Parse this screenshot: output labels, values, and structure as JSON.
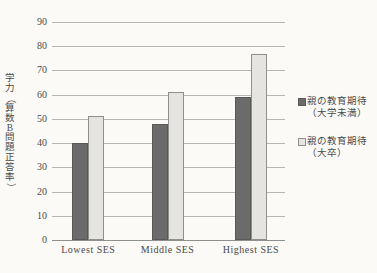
{
  "chart_data": {
    "type": "bar",
    "categories": [
      "Lowest SES",
      "Middle SES",
      "Highest SES"
    ],
    "series": [
      {
        "name": "親の教育期待（大学未満）",
        "color": "#6b6b6b",
        "values": [
          40,
          48,
          59
        ]
      },
      {
        "name": "親の教育期待（大卒）",
        "color": "#e5e4e1",
        "values": [
          51,
          61,
          77
        ]
      }
    ],
    "title": "",
    "xlabel": "",
    "ylabel": "学力（算数B問題正答率）",
    "ylim": [
      0,
      90
    ],
    "yticks": [
      0,
      10,
      20,
      30,
      40,
      50,
      60,
      70,
      80,
      90
    ],
    "grid": true,
    "legend_position": "right"
  },
  "legend": {
    "entries": [
      {
        "line1": "親の教育期待",
        "line2": "（大学未満）"
      },
      {
        "line1": "親の教育期待",
        "line2": "（大卒）"
      }
    ]
  },
  "colors": {
    "background": "#fbfaf7",
    "bar_dark": "#6b6b6b",
    "bar_light": "#e5e4e1",
    "gridline": "#b6b6b4",
    "text": "#4a4a4a"
  }
}
